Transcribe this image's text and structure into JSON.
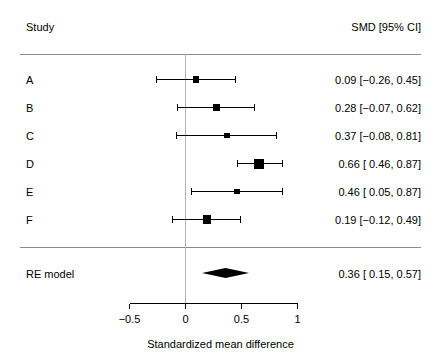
{
  "header": {
    "left_label": "Study",
    "right_label": "SMD [95% CI]"
  },
  "axis": {
    "title": "Standardized mean difference",
    "ticks": [
      "−0.5",
      "0",
      "0.5",
      "1"
    ],
    "tick_values": [
      -0.5,
      0,
      0.5,
      1
    ],
    "reference_value": 0
  },
  "rows": [
    {
      "label": "A",
      "estimate_text": "0.09 [−0.26, 0.45]"
    },
    {
      "label": "B",
      "estimate_text": "0.28 [−0.07, 0.62]"
    },
    {
      "label": "C",
      "estimate_text": "0.37 [−0.08, 0.81]"
    },
    {
      "label": "D",
      "estimate_text": "0.66 [ 0.46, 0.87]"
    },
    {
      "label": "E",
      "estimate_text": "0.46 [ 0.05, 0.87]"
    },
    {
      "label": "F",
      "estimate_text": "0.19 [−0.12, 0.49]"
    }
  ],
  "summary": {
    "label": "RE model",
    "estimate_text": "0.36 [ 0.15, 0.57]"
  },
  "chart_data": {
    "type": "forest",
    "title": "",
    "xlabel": "Standardized mean difference",
    "ylabel": "",
    "xlim": [
      -0.5,
      1.0
    ],
    "xticks": [
      -0.5,
      0,
      0.5,
      1
    ],
    "reference_line": 0,
    "effect_measure": "SMD",
    "ci_level": "95%",
    "grid": false,
    "legend": "none",
    "studies": [
      {
        "label": "A",
        "estimate": 0.09,
        "ci_lower": -0.26,
        "ci_upper": 0.45,
        "weight": 0.4
      },
      {
        "label": "B",
        "estimate": 0.28,
        "ci_lower": -0.07,
        "ci_upper": 0.62,
        "weight": 0.55
      },
      {
        "label": "C",
        "estimate": 0.37,
        "ci_lower": -0.08,
        "ci_upper": 0.81,
        "weight": 0.28
      },
      {
        "label": "D",
        "estimate": 0.66,
        "ci_lower": 0.46,
        "ci_upper": 0.87,
        "weight": 1.0
      },
      {
        "label": "E",
        "estimate": 0.46,
        "ci_lower": 0.05,
        "ci_upper": 0.87,
        "weight": 0.33
      },
      {
        "label": "F",
        "estimate": 0.19,
        "ci_lower": -0.12,
        "ci_upper": 0.49,
        "weight": 0.7
      }
    ],
    "summary": {
      "label": "RE model",
      "estimate": 0.36,
      "ci_lower": 0.15,
      "ci_upper": 0.57
    }
  },
  "geometry": {
    "x_zero_px": 185.5,
    "px_per_unit": 112,
    "row_y_start": 79,
    "row_spacing": 28,
    "summary_y": 273
  }
}
